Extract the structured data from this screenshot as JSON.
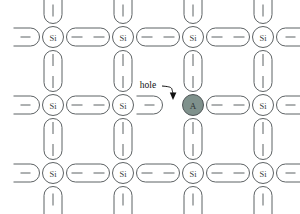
{
  "figure": {
    "background_color": "#ffffff",
    "bond_stroke_color": "#5d6264",
    "atom_stroke_color": "#5d6264",
    "atom_fill_color": "#ffffff",
    "acceptor_fill_color": "#7f918c",
    "acceptor_stroke_color": "#4f5557",
    "annotation_color": "#111111"
  },
  "lattice": {
    "columns": 4,
    "rows": 3,
    "column_x": [
      53,
      123,
      193,
      263
    ],
    "row_y": [
      37,
      105,
      173
    ],
    "atom_radius": 10.5,
    "acceptor_radius": 10.5,
    "atoms": [
      {
        "id": "si-r1c1",
        "label": "Si",
        "type": "silicon",
        "row": 0,
        "col": 0
      },
      {
        "id": "si-r1c2",
        "label": "Si",
        "type": "silicon",
        "row": 0,
        "col": 1
      },
      {
        "id": "si-r1c3",
        "label": "Si",
        "type": "silicon",
        "row": 0,
        "col": 2
      },
      {
        "id": "si-r1c4",
        "label": "Si",
        "type": "silicon",
        "row": 0,
        "col": 3
      },
      {
        "id": "si-r2c1",
        "label": "Si",
        "type": "silicon",
        "row": 1,
        "col": 0
      },
      {
        "id": "si-r2c2",
        "label": "Si",
        "type": "silicon",
        "row": 1,
        "col": 1
      },
      {
        "id": "a-r2c3",
        "label": "A",
        "type": "acceptor",
        "row": 1,
        "col": 2
      },
      {
        "id": "si-r2c4",
        "label": "Si",
        "type": "silicon",
        "row": 1,
        "col": 3
      },
      {
        "id": "si-r3c1",
        "label": "Si",
        "type": "silicon",
        "row": 2,
        "col": 0
      },
      {
        "id": "si-r3c2",
        "label": "Si",
        "type": "silicon",
        "row": 2,
        "col": 1
      },
      {
        "id": "si-r3c3",
        "label": "Si",
        "type": "silicon",
        "row": 2,
        "col": 2
      },
      {
        "id": "si-r3c4",
        "label": "Si",
        "type": "silicon",
        "row": 2,
        "col": 3
      }
    ],
    "bond_electron_counts": {
      "full_bond": 2,
      "edge_bond": 1,
      "broken_bond": 1
    },
    "broken_bond_note": "missing electron pair between Si(row 2, col 2) and acceptor A"
  },
  "annotations": {
    "hole_label": "hole",
    "hole_label_x": 148,
    "hole_label_y": 85,
    "arrow_tip_x": 174,
    "arrow_tip_y": 100
  },
  "legend_text": {
    "silicon_symbol": "Si",
    "acceptor_symbol": "A"
  }
}
